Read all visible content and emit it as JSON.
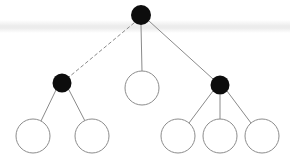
{
  "figure": {
    "type": "tree-diagram",
    "title": "",
    "width": 290,
    "height": 161,
    "background_color": "#ffffff"
  },
  "style": {
    "filled_node_color": "#0d0d0d",
    "open_node_fill": "#ffffff",
    "open_node_stroke": "#8c8c8c",
    "open_node_stroke_width": 1,
    "edge_color": "#8a8a8a",
    "edge_width": 1,
    "dashed_edge_color": "#8a8a8a",
    "dash_pattern": "3 3",
    "scan_band_color": "#e9e9e9"
  },
  "artifacts": {
    "scan_band": {
      "label": "horizontal-scan-band",
      "top": 20,
      "height": 13,
      "color": "#ececec"
    }
  },
  "graph": {
    "node_count": 9,
    "edge_count": 8,
    "levels": 3,
    "nodes": [
      {
        "id": "n0",
        "label": "root",
        "cx": 141,
        "cy": 15,
        "r": 10,
        "fill": "filled",
        "level": 0
      },
      {
        "id": "n1",
        "label": "left-branch",
        "cx": 62,
        "cy": 83,
        "r": 9.5,
        "fill": "filled",
        "level": 1
      },
      {
        "id": "n2",
        "label": "middle-leaf",
        "cx": 142,
        "cy": 88,
        "r": 17,
        "fill": "open",
        "level": 1
      },
      {
        "id": "n3",
        "label": "right-branch",
        "cx": 220,
        "cy": 85,
        "r": 9.5,
        "fill": "filled",
        "level": 1
      },
      {
        "id": "n4",
        "label": "leaf-1",
        "cx": 33,
        "cy": 136,
        "r": 17,
        "fill": "open",
        "level": 2
      },
      {
        "id": "n5",
        "label": "leaf-2",
        "cx": 92,
        "cy": 136,
        "r": 17,
        "fill": "open",
        "level": 2
      },
      {
        "id": "n6",
        "label": "leaf-3",
        "cx": 178,
        "cy": 136,
        "r": 17,
        "fill": "open",
        "level": 2
      },
      {
        "id": "n7",
        "label": "leaf-4",
        "cx": 220,
        "cy": 136,
        "r": 17,
        "fill": "open",
        "level": 2
      },
      {
        "id": "n8",
        "label": "leaf-5",
        "cx": 262,
        "cy": 136,
        "r": 17,
        "fill": "open",
        "level": 2
      }
    ],
    "edges": [
      {
        "id": "e0",
        "from": "n0",
        "to": "n1",
        "style": "dashed",
        "x1": 134,
        "y1": 23,
        "x2": 69,
        "y2": 77
      },
      {
        "id": "e1",
        "from": "n0",
        "to": "n2",
        "style": "solid",
        "x1": 141,
        "y1": 25,
        "x2": 142,
        "y2": 71
      },
      {
        "id": "e2",
        "from": "n0",
        "to": "n3",
        "style": "solid",
        "x1": 149,
        "y1": 21,
        "x2": 213,
        "y2": 79
      },
      {
        "id": "e3",
        "from": "n1",
        "to": "n4",
        "style": "solid",
        "x1": 56,
        "y1": 90,
        "x2": 41,
        "y2": 121
      },
      {
        "id": "e4",
        "from": "n1",
        "to": "n5",
        "style": "solid",
        "x1": 69,
        "y1": 90,
        "x2": 85,
        "y2": 121
      },
      {
        "id": "e5",
        "from": "n3",
        "to": "n6",
        "style": "solid",
        "x1": 213,
        "y1": 91,
        "x2": 189,
        "y2": 123
      },
      {
        "id": "e6",
        "from": "n3",
        "to": "n7",
        "style": "solid",
        "x1": 220,
        "y1": 95,
        "x2": 220,
        "y2": 119
      },
      {
        "id": "e7",
        "from": "n3",
        "to": "n8",
        "style": "solid",
        "x1": 227,
        "y1": 91,
        "x2": 251,
        "y2": 123
      }
    ]
  }
}
